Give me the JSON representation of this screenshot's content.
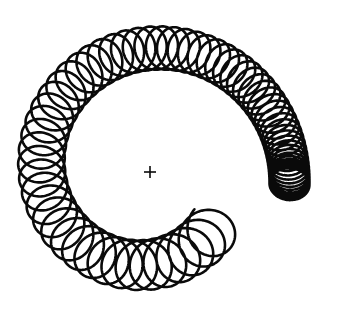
{
  "figure": {
    "canvas": {
      "width": 340,
      "height": 327,
      "background": "#ffffff"
    },
    "stroke_color": "#0a0a0a",
    "center_marker": {
      "symbol": "+",
      "x": 150,
      "y": 172,
      "size": 12
    },
    "coil": {
      "center": {
        "x": 150,
        "y": 172
      },
      "start_angle_deg": 40,
      "end_angle_deg": 365,
      "path_radius_start": 84,
      "path_radius_end": 140,
      "loop_count": 66,
      "loop_radial_amplitude_start": 26,
      "loop_radial_amplitude_end": 20,
      "loop_tangential_amplitude_start": 26,
      "loop_tangential_amplitude_end": 16,
      "density_exponent": 1.9,
      "open_end": {
        "x": 257,
        "y": 204
      },
      "tight_end": {
        "x": 292,
        "y": 185
      }
    }
  }
}
